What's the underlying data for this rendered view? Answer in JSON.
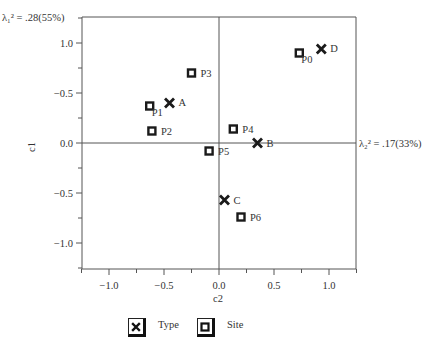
{
  "chart_data": {
    "type": "scatter",
    "title": "",
    "xlabel": "c2",
    "ylabel": "c1",
    "xlim": [
      -1.25,
      1.25
    ],
    "ylim": [
      -1.25,
      1.25
    ],
    "x_ticks": [
      -1.0,
      -0.5,
      0.0,
      0.5,
      1.0
    ],
    "x_tick_labels": [
      "−1.0",
      "−0.5",
      "0.0",
      "0.5",
      "1.0"
    ],
    "y_ticks": [
      1.0,
      0.5,
      0.0,
      -0.5,
      -1.0
    ],
    "y_tick_labels": [
      "1.0",
      "−0.5",
      "0.0",
      "−0.5",
      "−1.0"
    ],
    "grid": false,
    "axis_annotations": {
      "vertical": "λ₁² = .28(55%)",
      "horizontal": "λ₂² = .17(33%)"
    },
    "legend_position": "bottom",
    "series": [
      {
        "name": "Type",
        "marker": "x",
        "points": [
          {
            "label": "A",
            "x": -0.45,
            "y": 0.4
          },
          {
            "label": "B",
            "x": 0.35,
            "y": 0.0
          },
          {
            "label": "C",
            "x": 0.05,
            "y": -0.57
          },
          {
            "label": "D",
            "x": 0.93,
            "y": 0.94
          }
        ]
      },
      {
        "name": "Site",
        "marker": "square",
        "points": [
          {
            "label": "P0",
            "x": 0.73,
            "y": 0.9
          },
          {
            "label": "P1",
            "x": -0.63,
            "y": 0.37
          },
          {
            "label": "P2",
            "x": -0.61,
            "y": 0.12
          },
          {
            "label": "P3",
            "x": -0.25,
            "y": 0.7
          },
          {
            "label": "P4",
            "x": 0.13,
            "y": 0.14
          },
          {
            "label": "P5",
            "x": -0.09,
            "y": -0.08
          },
          {
            "label": "P6",
            "x": 0.2,
            "y": -0.74
          }
        ]
      }
    ]
  },
  "legend": {
    "type_label": "Type",
    "site_label": "Site"
  },
  "colors": {
    "ink": "#1a1a1a",
    "axis": "#555555",
    "text": "#333333"
  }
}
